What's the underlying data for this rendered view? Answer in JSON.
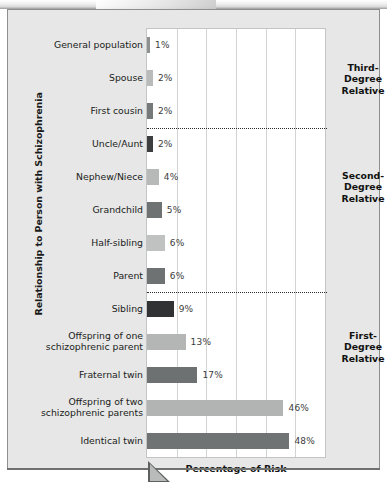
{
  "chart_data": {
    "type": "bar",
    "orientation": "horizontal",
    "title": "",
    "xlabel": "Percentage of Risk",
    "ylabel": "Relationship to Person with Schizophrenia",
    "xlim": [
      0,
      60
    ],
    "grid": true,
    "gridline_values": [
      10,
      20,
      30,
      40,
      50
    ],
    "legend": "none",
    "categories": [
      "General population",
      "Spouse",
      "First cousin",
      "Uncle/Aunt",
      "Nephew/Niece",
      "Grandchild",
      "Half-sibling",
      "Parent",
      "Sibling",
      "Offspring of one schizophrenic parent",
      "Fraternal twin",
      "Offspring of two schizophrenic parents",
      "Identical twin"
    ],
    "values": [
      1,
      2,
      2,
      2,
      4,
      5,
      6,
      6,
      9,
      13,
      17,
      46,
      48
    ],
    "value_labels": [
      "1%",
      "2%",
      "2%",
      "2%",
      "4%",
      "5%",
      "6%",
      "6%",
      "9%",
      "13%",
      "17%",
      "46%",
      "48%"
    ],
    "bar_colors": [
      "#8f9190",
      "#b9bbba",
      "#76797a",
      "#3b3d3e",
      "#b7b9b8",
      "#6f7273",
      "#c0c2c1",
      "#6f7273",
      "#303233",
      "#b4b6b5",
      "#6e7172",
      "#b2b4b3",
      "#707374"
    ],
    "groups": [
      {
        "label": "Third-\nDegree\nRelative",
        "lines": [
          "Third-",
          "Degree",
          "Relative"
        ]
      },
      {
        "label": "Second-\nDegree\nRelative",
        "lines": [
          "Second-",
          "Degree",
          "Relative"
        ]
      },
      {
        "label": "First-\nDegree\nRelative",
        "lines": [
          "First-",
          "Degree",
          "Relative"
        ]
      }
    ],
    "group_dividers_after_index": [
      2,
      7
    ]
  },
  "axes": {
    "x_title": "Percentage of Risk",
    "y_title": "Relationship to Person with Schizophrenia"
  },
  "group_labels": {
    "third": {
      "l1": "Third-",
      "l2": "Degree",
      "l3": "Relative"
    },
    "second": {
      "l1": "Second-",
      "l2": "Degree",
      "l3": "Relative"
    },
    "first": {
      "l1": "First-",
      "l2": "Degree",
      "l3": "Relative"
    }
  }
}
